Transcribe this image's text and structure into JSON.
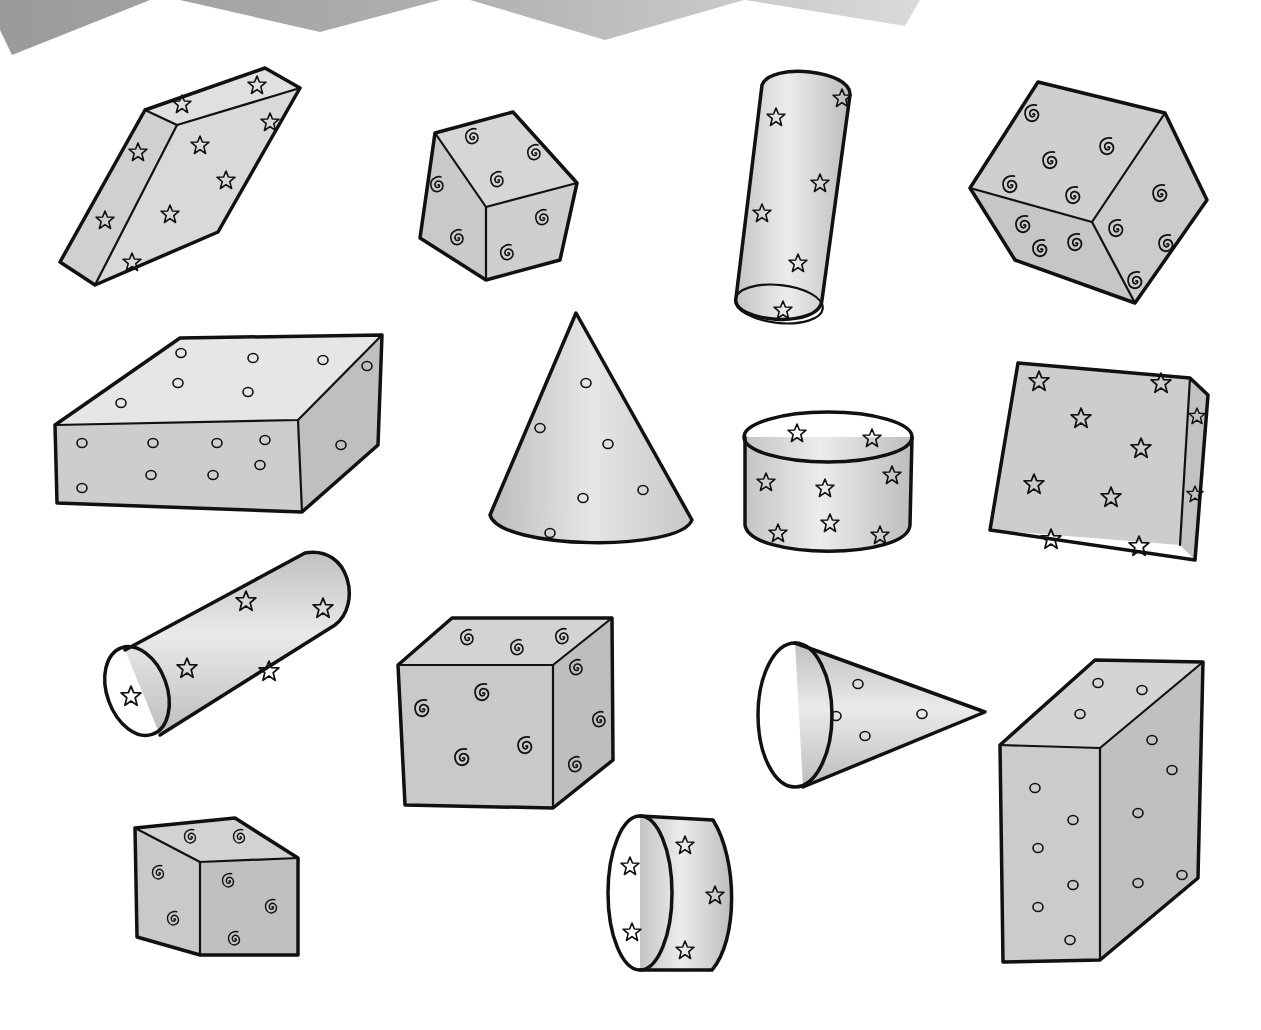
{
  "illustration": {
    "subject": "hand-drawn 3D geometric solids with patterned surfaces",
    "colors": {
      "outline": "#111111",
      "light_face": "#e4e4e4",
      "mid_face": "#cfcfcf",
      "dark_face": "#b8b8b8",
      "banner_left": "#9a9a9a",
      "banner_mid": "#b0b0b0",
      "banner_right": "#d8d8d8",
      "background": "#ffffff"
    },
    "banner": {
      "shape": "zigzag",
      "points": 4
    },
    "shapes": [
      {
        "id": "slanted-prism-stars",
        "type": "rectangular-prism",
        "pattern": "stars"
      },
      {
        "id": "cube-spirals-small",
        "type": "cube",
        "pattern": "spirals"
      },
      {
        "id": "tall-cylinder-stars",
        "type": "cylinder",
        "pattern": "stars"
      },
      {
        "id": "tilted-cube-spirals",
        "type": "cube",
        "pattern": "spirals"
      },
      {
        "id": "flat-box-circles",
        "type": "rectangular-prism",
        "pattern": "circles"
      },
      {
        "id": "upright-cone-circles",
        "type": "cone",
        "pattern": "circles"
      },
      {
        "id": "short-cylinder-stars",
        "type": "cylinder",
        "pattern": "stars"
      },
      {
        "id": "square-prism-stars",
        "type": "rectangular-prism",
        "pattern": "stars"
      },
      {
        "id": "lying-cylinder-stars",
        "type": "cylinder",
        "pattern": "stars"
      },
      {
        "id": "large-cube-spirals",
        "type": "cube",
        "pattern": "spirals"
      },
      {
        "id": "sideways-cone-circles",
        "type": "cone",
        "pattern": "circles"
      },
      {
        "id": "tall-box-circles",
        "type": "rectangular-prism",
        "pattern": "circles"
      },
      {
        "id": "small-cube-spirals",
        "type": "cube",
        "pattern": "spirals"
      },
      {
        "id": "drum-cylinder-stars",
        "type": "cylinder",
        "pattern": "stars"
      }
    ]
  }
}
